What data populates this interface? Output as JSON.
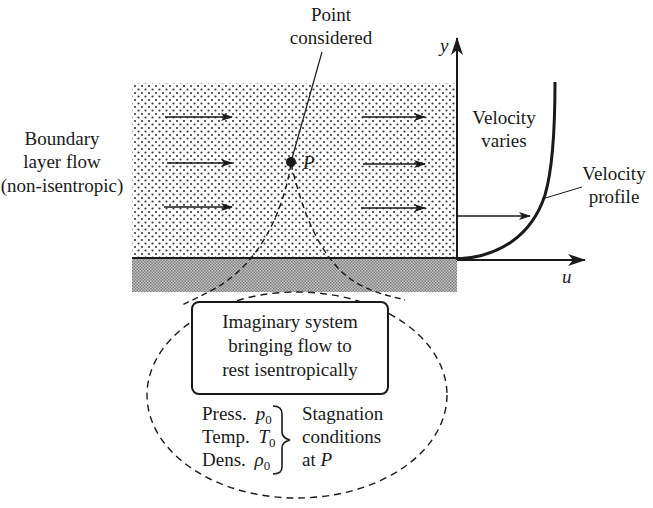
{
  "diagram": {
    "labels": {
      "point_considered": [
        "Point",
        "considered"
      ],
      "boundary_layer": [
        "Boundary",
        "layer flow",
        "(non-isentropic)"
      ],
      "velocity_varies": [
        "Velocity",
        "varies"
      ],
      "velocity_profile": [
        "Velocity",
        "profile"
      ],
      "point_name": "P",
      "y_axis": "y",
      "u_axis": "u"
    },
    "system_box": {
      "lines": [
        "Imaginary system",
        "bringing flow to",
        "rest isentropically"
      ]
    },
    "stagnation": {
      "properties": [
        {
          "name": "Press.",
          "symbol": "p",
          "subscript": "0"
        },
        {
          "name": "Temp.",
          "symbol": "T",
          "subscript": "0"
        },
        {
          "name": "Dens.",
          "symbol": "ρ",
          "subscript": "0"
        }
      ],
      "result_lines": [
        "Stagnation",
        "conditions",
        "at P"
      ]
    },
    "colors": {
      "ink": "#1a1a1a",
      "dots": "#3a3a3a",
      "wall": "#9a9a9a",
      "background": "#ffffff"
    }
  }
}
